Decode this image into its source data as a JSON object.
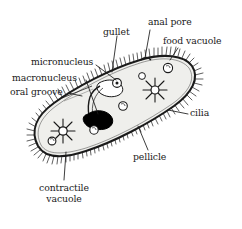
{
  "figure": {
    "type": "labeled biological diagram",
    "background_color": "#ffffff",
    "ink_color": "#1a1a1a",
    "cytoplasm_color": "#efefec",
    "nucleus_color": "#000000"
  },
  "labels": {
    "anal_pore": "anal pore",
    "gullet": "gullet",
    "food_vacuole": "food vacuole",
    "micronucleus": "micronucleus",
    "macronucleus": "macronucleus",
    "oral_groove": "oral groove",
    "cilia": "cilia",
    "pellicle": "pellicle",
    "contractile_vacuole_line1": "contractile",
    "contractile_vacuole_line2": "vacuole"
  },
  "structures": [
    {
      "name": "pellicle",
      "description": "outer cell membrane outline of the slipper-shaped body"
    },
    {
      "name": "cilia",
      "description": "fine hairs radiating around the entire pellicle"
    },
    {
      "name": "oral groove",
      "description": "indentation on the upper-left margin leading to the gullet"
    },
    {
      "name": "gullet",
      "description": "funnel tube descending from the oral groove into the cytoplasm"
    },
    {
      "name": "macronucleus",
      "description": "large solid black kidney-shaped body near the centre"
    },
    {
      "name": "micronucleus",
      "description": "small round body adjacent to the macronucleus"
    },
    {
      "name": "food vacuole",
      "description": "small circular vacuoles scattered in the cytoplasm"
    },
    {
      "name": "anal pore",
      "description": "opening on the upper margin right of the gullet"
    },
    {
      "name": "contractile vacuole",
      "description": "two star-shaped vacuoles with radiating canals, one at each end"
    }
  ]
}
